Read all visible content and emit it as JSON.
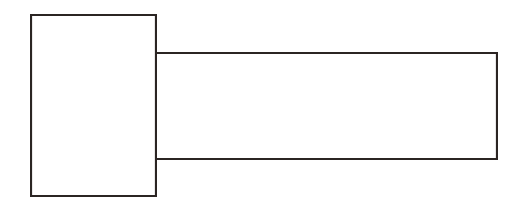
{
  "figure": {
    "description": "Two-dimensional orthographic outline of a headed fastener: a tall rectangular head at left joined to a long rectangular shank extending to the right.",
    "background_color": "#fefefe",
    "stroke_color": "#2b2523",
    "fill_color": "#ffffff",
    "stroke_width": 2.1,
    "canvas": {
      "width": 514,
      "height": 208
    },
    "parts": [
      {
        "id": "head",
        "name": "head-rectangle",
        "label": "Head",
        "x": 30,
        "y": 14,
        "width": 127,
        "height": 183
      },
      {
        "id": "shank",
        "name": "shank-rectangle",
        "label": "Shank",
        "x": 157,
        "y": 52,
        "width": 341,
        "height": 108
      }
    ],
    "edges": [
      {
        "id": "shank-top-edge",
        "name": "shank-top-edge",
        "x1": 157,
        "y1": 53,
        "x2": 498,
        "y2": 53
      },
      {
        "id": "shank-right-edge",
        "name": "shank-right-edge",
        "x1": 497,
        "y1": 53,
        "x2": 497,
        "y2": 159
      },
      {
        "id": "shank-bottom-edge",
        "name": "shank-bottom-edge",
        "x1": 157,
        "y1": 159,
        "x2": 498,
        "y2": 159
      },
      {
        "id": "head-top-edge",
        "name": "head-top-edge",
        "x1": 31,
        "y1": 15,
        "x2": 156,
        "y2": 15
      },
      {
        "id": "head-left-edge",
        "name": "head-left-edge",
        "x1": 31,
        "y1": 15,
        "x2": 31,
        "y2": 196
      },
      {
        "id": "head-bottom-edge",
        "name": "head-bottom-edge",
        "x1": 31,
        "y1": 196,
        "x2": 156,
        "y2": 196
      },
      {
        "id": "head-right-edge",
        "name": "head-right-edge",
        "x1": 156,
        "y1": 15,
        "x2": 156,
        "y2": 196
      }
    ]
  }
}
